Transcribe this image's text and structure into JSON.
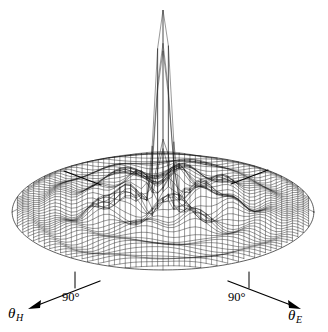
{
  "figure": {
    "title": "",
    "background_color": "#ffffff",
    "ink_color": "#1a1a1a",
    "width": 328,
    "height": 332
  },
  "axes": {
    "h_plane": {
      "label": "θ",
      "subscript": "H",
      "tick_label": "90°"
    },
    "e_plane": {
      "label": "θ",
      "subscript": "E",
      "tick_label": "90°"
    }
  },
  "chart_data": {
    "type": "surface",
    "title": "",
    "xlabel": "θ_H",
    "ylabel": "θ_E",
    "zlabel": "",
    "projection": "oblique-3d-wireframe",
    "grid": true,
    "legend": null,
    "xlim": [
      -90,
      90
    ],
    "ylim": [
      -90,
      90
    ],
    "zlim": [
      0,
      1
    ],
    "x_tick_labels": [
      "90°"
    ],
    "y_tick_labels": [
      "90°"
    ],
    "mesh": {
      "rows": 56,
      "cols": 56,
      "style": "hidden-line wireframe",
      "line_color": "#1a1a1a",
      "line_width": 0.45
    },
    "main_lobe": {
      "peak_value": 1.0,
      "peak_x": 0,
      "peak_y": 0,
      "beamwidth_x_deg": 11,
      "beamwidth_y_deg": 11,
      "apex_pixel": [
        160,
        10
      ]
    },
    "sidelobe_floor": {
      "mean_level": 0.055,
      "max_level": 0.16,
      "ripple_count": 9
    },
    "base_disk": {
      "center_pixel": [
        163,
        212
      ],
      "radius_x_pixel": 151,
      "radius_y_pixel": 58
    }
  }
}
